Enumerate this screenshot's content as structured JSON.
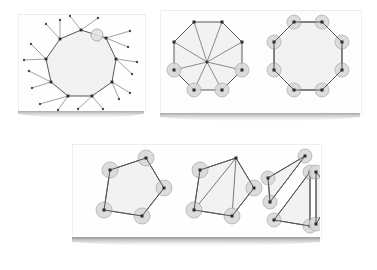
{
  "document": {
    "title": "Polygon Triangulation and Interior Angle Figures",
    "background_color": "#ffffff"
  },
  "style": {
    "paper_fill": "#fefefe",
    "polygon_fill": "#f2f2f2",
    "polygon_stroke": "#585858",
    "vertex_color": "#2b2b2b",
    "diagonal_stroke": "#707070",
    "angle_arc_fill": "#d8d8d8",
    "angle_arc_stroke": "#a8a8a8",
    "spike_stroke": "#8a8a8a",
    "spike_dot_color": "#4a4a4a",
    "shadow_color": "#8f8f8f"
  },
  "panels": [
    {
      "id": "polygon-spikes",
      "name": "polygon-with-exterior-spikes",
      "label": "Polygon with exterior rays",
      "figure_type": "polygon-exterior-angles",
      "x": 18,
      "y": 14,
      "width": 126,
      "height": 98,
      "figures": [
        {
          "id": "nonagon-spikes",
          "name": "irregular-nonagon-with-rays",
          "shape": "nonagon",
          "vertex_count": 9,
          "vertices": [
            [
              63,
              16
            ],
            [
              88,
              24
            ],
            [
              98,
              45
            ],
            [
              94,
              68
            ],
            [
              74,
              82
            ],
            [
              50,
              82
            ],
            [
              33,
              68
            ],
            [
              28,
              45
            ],
            [
              42,
              25
            ]
          ],
          "rays": [
            {
              "from": [
                63,
                16
              ],
              "to": [
                52,
                2
              ]
            },
            {
              "from": [
                63,
                16
              ],
              "to": [
                80,
                4
              ]
            },
            {
              "from": [
                88,
                24
              ],
              "to": [
                112,
                17
              ]
            },
            {
              "from": [
                88,
                24
              ],
              "to": [
                110,
                33
              ]
            },
            {
              "from": [
                98,
                45
              ],
              "to": [
                119,
                48
              ]
            },
            {
              "from": [
                98,
                45
              ],
              "to": [
                114,
                60
              ]
            },
            {
              "from": [
                94,
                68
              ],
              "to": [
                112,
                79
              ]
            },
            {
              "from": [
                94,
                68
              ],
              "to": [
                101,
                85
              ]
            },
            {
              "from": [
                74,
                82
              ],
              "to": [
                85,
                95
              ]
            },
            {
              "from": [
                74,
                82
              ],
              "to": [
                60,
                95
              ]
            },
            {
              "from": [
                50,
                82
              ],
              "to": [
                40,
                96
              ]
            },
            {
              "from": [
                50,
                82
              ],
              "to": [
                22,
                90
              ]
            },
            {
              "from": [
                33,
                68
              ],
              "to": [
                14,
                74
              ]
            },
            {
              "from": [
                33,
                68
              ],
              "to": [
                11,
                57
              ]
            },
            {
              "from": [
                28,
                45
              ],
              "to": [
                6,
                46
              ]
            },
            {
              "from": [
                28,
                45
              ],
              "to": [
                13,
                30
              ]
            },
            {
              "from": [
                42,
                25
              ],
              "to": [
                28,
                10
              ]
            },
            {
              "from": [
                42,
                25
              ],
              "to": [
                42,
                6
              ]
            }
          ],
          "marker": {
            "name": "highlight-angle-circle",
            "center": [
              79,
              21
            ],
            "radius": 6
          }
        }
      ]
    },
    {
      "id": "octagons",
      "name": "octagon-pair-panel",
      "label": "Octagon fan triangulation and interior angles",
      "figure_type": "octagon-comparison",
      "x": 160,
      "y": 10,
      "width": 200,
      "height": 104,
      "figures": [
        {
          "id": "octagon-fan",
          "name": "octagon-fan-triangulation",
          "shape": "octagon",
          "vertex_count": 8,
          "triangle_count": 8,
          "center": [
            47,
            52
          ],
          "vertices": [
            [
              34,
              12
            ],
            [
              62,
              12
            ],
            [
              82,
              32
            ],
            [
              82,
              60
            ],
            [
              62,
              80
            ],
            [
              34,
              80
            ],
            [
              14,
              60
            ],
            [
              14,
              32
            ]
          ],
          "diagonals_from_center": true,
          "angle_arcs": [
            {
              "vertex": [
                82,
                60
              ],
              "radius": 9
            },
            {
              "vertex": [
                14,
                60
              ],
              "radius": 9
            },
            {
              "vertex": [
                34,
                80
              ],
              "radius": 9
            },
            {
              "vertex": [
                62,
                80
              ],
              "radius": 9
            }
          ]
        },
        {
          "id": "octagon-angles",
          "name": "octagon-interior-angles",
          "shape": "octagon",
          "vertex_count": 8,
          "vertices": [
            [
              134,
              12
            ],
            [
              162,
              12
            ],
            [
              182,
              32
            ],
            [
              182,
              60
            ],
            [
              162,
              80
            ],
            [
              134,
              80
            ],
            [
              114,
              60
            ],
            [
              114,
              32
            ]
          ],
          "diagonals_from_center": false,
          "angle_arcs": [
            {
              "vertex": [
                134,
                12
              ],
              "radius": 9
            },
            {
              "vertex": [
                162,
                12
              ],
              "radius": 9
            },
            {
              "vertex": [
                182,
                32
              ],
              "radius": 9
            },
            {
              "vertex": [
                182,
                60
              ],
              "radius": 9
            },
            {
              "vertex": [
                162,
                80
              ],
              "radius": 9
            },
            {
              "vertex": [
                134,
                80
              ],
              "radius": 9
            },
            {
              "vertex": [
                114,
                60
              ],
              "radius": 9
            },
            {
              "vertex": [
                114,
                32
              ],
              "radius": 9
            }
          ]
        }
      ]
    },
    {
      "id": "triangulation",
      "name": "pentagon-triangulation-panel",
      "label": "Pentagon triangulation sequence",
      "figure_type": "pentagon-decomposition-steps",
      "x": 72,
      "y": 144,
      "width": 248,
      "height": 94,
      "figures": [
        {
          "id": "pentagon-plain",
          "name": "pentagon-interior-angles",
          "step": 1,
          "shape": "pentagon",
          "vertex_count": 5,
          "vertices": [
            [
              38,
              26
            ],
            [
              74,
              14
            ],
            [
              92,
              44
            ],
            [
              70,
              72
            ],
            [
              32,
              66
            ]
          ],
          "diagonals": [],
          "angle_arcs": [
            {
              "vertex": [
                38,
                26
              ],
              "radius": 10
            },
            {
              "vertex": [
                74,
                14
              ],
              "radius": 10
            },
            {
              "vertex": [
                92,
                44
              ],
              "radius": 10
            },
            {
              "vertex": [
                70,
                72
              ],
              "radius": 10
            },
            {
              "vertex": [
                32,
                66
              ],
              "radius": 10
            }
          ]
        },
        {
          "id": "pentagon-triangulated",
          "name": "pentagon-with-diagonals",
          "step": 2,
          "shape": "pentagon",
          "vertex_count": 5,
          "triangle_count": 3,
          "vertices": [
            [
              128,
              26
            ],
            [
              164,
              14
            ],
            [
              182,
              44
            ],
            [
              160,
              72
            ],
            [
              122,
              66
            ]
          ],
          "diagonals": [
            {
              "from": [
                164,
                14
              ],
              "to": [
                122,
                66
              ]
            },
            {
              "from": [
                164,
                14
              ],
              "to": [
                160,
                72
              ]
            }
          ],
          "angle_arcs": [
            {
              "vertex": [
                128,
                26
              ],
              "radius": 10
            },
            {
              "vertex": [
                182,
                44
              ],
              "radius": 10
            },
            {
              "vertex": [
                160,
                72
              ],
              "radius": 10
            },
            {
              "vertex": [
                122,
                66
              ],
              "radius": 10
            }
          ]
        },
        {
          "id": "triangles-exploded",
          "name": "separated-triangles",
          "step": 3,
          "shape": "triangle-group",
          "triangle_count": 3,
          "triangles": [
            {
              "name": "triangle-upper-left",
              "vertices": [
                [
                  196,
                  34
                ],
                [
                  233,
                  12
                ],
                [
                  198,
                  58
                ]
              ],
              "angle_arcs": [
                {
                  "vertex": [
                    196,
                    34
                  ],
                  "radius": 9
                },
                {
                  "vertex": [
                    233,
                    12
                  ],
                  "radius": 9
                },
                {
                  "vertex": [
                    198,
                    58
                  ],
                  "radius": 9
                }
              ]
            },
            {
              "name": "triangle-lower-middle",
              "vertices": [
                [
                  238,
                  28
                ],
                [
                  238,
                  82
                ],
                [
                  202,
                  76
                ]
              ],
              "angle_arcs": [
                {
                  "vertex": [
                    238,
                    28
                  ],
                  "radius": 9
                },
                {
                  "vertex": [
                    238,
                    82
                  ],
                  "radius": 9
                },
                {
                  "vertex": [
                    202,
                    76
                  ],
                  "radius": 9
                }
              ]
            },
            {
              "name": "triangle-right",
              "vertices": [
                [
                  244,
                  28
                ],
                [
                  262,
                  50
                ],
                [
                  244,
                  80
                ]
              ],
              "angle_arcs": [
                {
                  "vertex": [
                    244,
                    28
                  ],
                  "radius": 9
                },
                {
                  "vertex": [
                    262,
                    50
                  ],
                  "radius": 9
                },
                {
                  "vertex": [
                    244,
                    80
                  ],
                  "radius": 9
                }
              ]
            }
          ]
        }
      ]
    }
  ]
}
